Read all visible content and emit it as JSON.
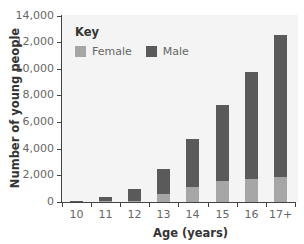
{
  "chart_data": {
    "type": "bar",
    "stacked": true,
    "title": "",
    "xlabel": "Age (years)",
    "ylabel": "Number of young people",
    "categories": [
      "10",
      "11",
      "12",
      "13",
      "14",
      "15",
      "16",
      "17+"
    ],
    "series": [
      {
        "name": "Female",
        "color": "#a6a6a6",
        "values": [
          20,
          50,
          100,
          600,
          1100,
          1600,
          1700,
          1900
        ]
      },
      {
        "name": "Male",
        "color": "#5a5a5a",
        "values": [
          80,
          300,
          900,
          1900,
          3600,
          5700,
          8050,
          10600
        ]
      }
    ],
    "totals": [
      100,
      350,
      1000,
      2500,
      4700,
      7300,
      9750,
      12500
    ],
    "ylim": [
      0,
      14000
    ],
    "yticks": [
      "0",
      "2,000",
      "4,000",
      "6,000",
      "8,000",
      "10,000",
      "12,000",
      "14,000"
    ],
    "ytick_values": [
      0,
      2000,
      4000,
      6000,
      8000,
      10000,
      12000,
      14000
    ],
    "grid": false,
    "legend": {
      "title": "Key",
      "position": "upper-left",
      "entries": [
        "Female",
        "Male"
      ]
    }
  },
  "colors": {
    "female": "#a6a6a6",
    "male": "#5a5a5a",
    "plot_background": "#f4f4f4",
    "axis": "#444444"
  }
}
